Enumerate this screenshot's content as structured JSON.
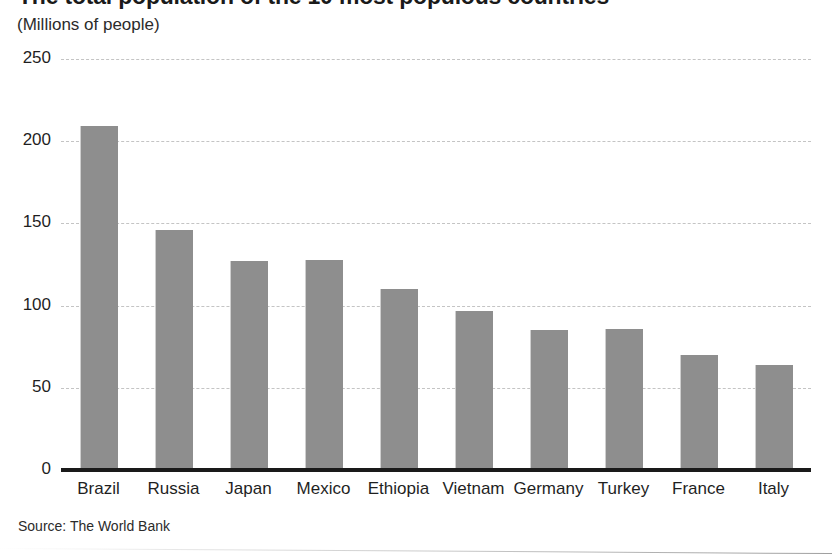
{
  "figure": {
    "title": "The total population of the 10 most populous countries",
    "subtitle": "(Millions of people)",
    "source": "Source: The World Bank"
  },
  "chart_data": {
    "type": "bar",
    "title": "The total population of the 10 most populous countries",
    "subtitle": "(Millions of people)",
    "xlabel": "",
    "ylabel": "Millions of people",
    "ylim": [
      0,
      250
    ],
    "yticks": [
      0,
      50,
      100,
      150,
      200,
      250
    ],
    "ytick_labels": [
      "0",
      "50",
      "100",
      "150",
      "200",
      "250"
    ],
    "grid": "horizontal-dashed",
    "legend": "none",
    "bar_color": "#8e8e8e",
    "categories": [
      "Brazil",
      "Russia",
      "Japan",
      "Mexico",
      "Ethiopia",
      "Vietnam",
      "Germany",
      "Turkey",
      "France",
      "Italy"
    ],
    "values": [
      209,
      146,
      127,
      128,
      110,
      97,
      85,
      86,
      70,
      64
    ],
    "source": "Source: The World Bank"
  }
}
